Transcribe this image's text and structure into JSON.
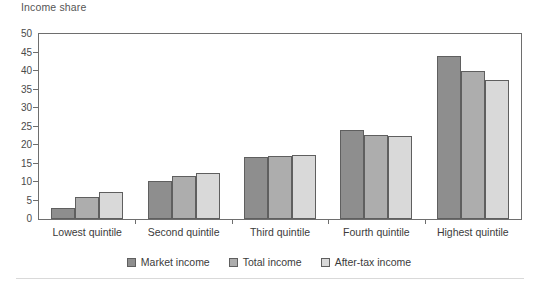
{
  "chart_data": {
    "type": "bar",
    "title": "Income share",
    "xlabel": "",
    "ylabel": "",
    "ylim": [
      0,
      50
    ],
    "ytick_step": 5,
    "yticks": [
      0,
      5,
      10,
      15,
      20,
      25,
      30,
      35,
      40,
      45,
      50
    ],
    "grid": false,
    "legend_position": "bottom-center",
    "categories": [
      "Lowest quintile",
      "Second quintile",
      "Third quintile",
      "Fourth quintile",
      "Highest quintile"
    ],
    "series": [
      {
        "name": "Market income",
        "color": "#8e8e8e",
        "values": [
          3.0,
          10.2,
          16.8,
          24.0,
          44.0
        ]
      },
      {
        "name": "Total income",
        "color": "#adadad",
        "values": [
          6.0,
          11.5,
          16.9,
          22.6,
          40.0
        ]
      },
      {
        "name": "After-tax income",
        "color": "#d9d9d9",
        "values": [
          7.3,
          12.4,
          17.3,
          22.5,
          37.5
        ]
      }
    ]
  },
  "axis": {
    "tick_labels": [
      "0",
      "5",
      "10",
      "15",
      "20",
      "25",
      "30",
      "35",
      "40",
      "45",
      "50"
    ]
  },
  "colors": {
    "market_income": "#8e8e8e",
    "total_income": "#adadad",
    "after_tax_income": "#d9d9d9",
    "axis_line": "#6e6e6e",
    "bar_outline": "#5f5f5f",
    "text": "#3b3b3b",
    "title_text": "#555555"
  }
}
